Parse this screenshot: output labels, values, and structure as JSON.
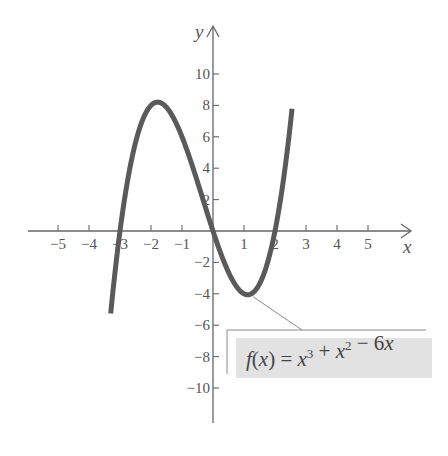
{
  "chart_data": {
    "type": "line",
    "title": "",
    "function": "f(x) = x^3 + x^2 - 6x",
    "xlabel": "x",
    "ylabel": "y",
    "xlim": [
      -5.8,
      6.0
    ],
    "ylim": [
      -12.2,
      12.5
    ],
    "x_ticks": [
      -5,
      -4,
      -3,
      -2,
      -1,
      1,
      2,
      3,
      4,
      5
    ],
    "x_tick_labels": [
      "−5",
      "−4",
      "−3",
      "−2",
      "−1",
      "1",
      "2",
      "3",
      "4",
      "5"
    ],
    "y_ticks": [
      10,
      8,
      6,
      4,
      2,
      -2,
      -4,
      -6,
      -8,
      -10
    ],
    "y_tick_labels": [
      "10",
      "8",
      "6",
      "4",
      "2",
      "−2",
      "−4",
      "−6",
      "−8",
      "−10"
    ],
    "grid": false,
    "curve_domain": [
      -3.3,
      2.55
    ],
    "series": [
      {
        "name": "f(x) = x^3 + x^2 - 6x",
        "x": [
          -3.3,
          -3.0,
          -2.5,
          -2.0,
          -1.79,
          -1.5,
          -1.0,
          -0.5,
          0.0,
          0.5,
          1.0,
          1.12,
          1.5,
          2.0,
          2.5,
          2.55
        ],
        "y": [
          -12.2,
          0.0,
          5.63,
          8.0,
          8.21,
          7.88,
          6.0,
          3.13,
          0.0,
          -2.63,
          -4.0,
          -4.06,
          -3.38,
          0.0,
          6.88,
          7.85
        ]
      }
    ],
    "key_points": {
      "roots": [
        -3,
        0,
        2
      ],
      "local_max": [
        -1.79,
        8.21
      ],
      "local_min": [
        1.12,
        -4.06
      ]
    },
    "annotation": {
      "text_parts": [
        {
          "t": "f",
          "italic": true
        },
        {
          "t": "(",
          "italic": false
        },
        {
          "t": "x",
          "italic": true
        },
        {
          "t": ") = ",
          "italic": false
        },
        {
          "t": "x",
          "italic": true
        },
        {
          "t": "3",
          "sup": true
        },
        {
          "t": " + ",
          "italic": false
        },
        {
          "t": "x",
          "italic": true
        },
        {
          "t": "2",
          "sup": true
        },
        {
          "t": " − 6",
          "italic": false
        },
        {
          "t": "x",
          "italic": true
        }
      ],
      "points_to": [
        1.2,
        -4.0
      ]
    }
  },
  "colors": {
    "curve": "#5a5a5a",
    "axis": "#666666",
    "box_fill": "#e2e2e2",
    "box_line": "#8a8a8a"
  },
  "layout": {
    "origin_px": [
      213,
      231
    ],
    "px_per_unit_x": 31,
    "px_per_unit_y": 15.7
  }
}
